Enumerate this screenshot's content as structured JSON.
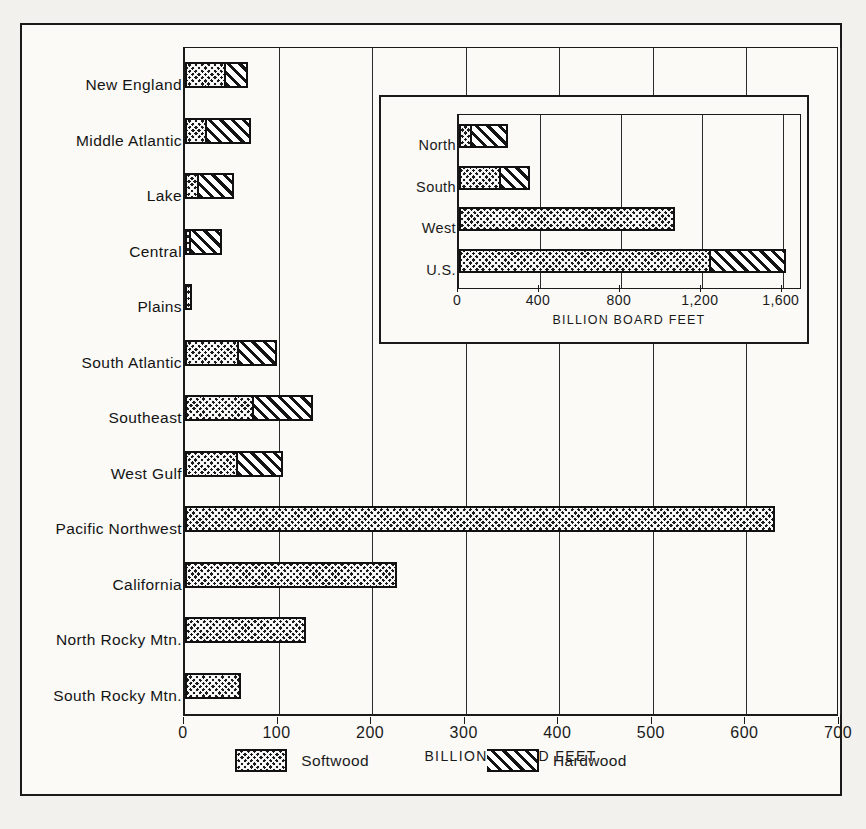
{
  "figure": {
    "legend": [
      {
        "key": "softwood",
        "label": "Softwood",
        "pattern": "crosshatch"
      },
      {
        "key": "hardwood",
        "label": "Hardwood",
        "pattern": "diagonal-hatch"
      }
    ]
  },
  "chart_data": [
    {
      "id": "main",
      "type": "bar",
      "orientation": "horizontal",
      "stacked": true,
      "title": "",
      "xlabel": "BILLION BOARD FEET",
      "ylabel": "",
      "xlim": [
        0,
        700
      ],
      "xticks": [
        0,
        100,
        200,
        300,
        400,
        500,
        600,
        700
      ],
      "xtick_labels": [
        "0",
        "100",
        "200",
        "300",
        "400",
        "500",
        "600",
        "700"
      ],
      "grid": "vertical",
      "legend_position": "bottom-center",
      "categories": [
        "New England",
        "Middle Atlantic",
        "Lake",
        "Central",
        "Plains",
        "South Atlantic",
        "Southeast",
        "West Gulf",
        "Pacific Northwest",
        "California",
        "North Rocky Mtn.",
        "South Rocky Mtn."
      ],
      "series": [
        {
          "name": "Softwood",
          "values": [
            42,
            20,
            12,
            2,
            8,
            56,
            72,
            55,
            630,
            227,
            129,
            60
          ]
        },
        {
          "name": "Hardwood",
          "values": [
            25,
            50,
            40,
            38,
            0,
            42,
            65,
            50,
            0,
            0,
            0,
            0
          ]
        }
      ],
      "totals": [
        67,
        70,
        52,
        40,
        8,
        98,
        137,
        105,
        630,
        227,
        129,
        60
      ]
    },
    {
      "id": "inset",
      "type": "bar",
      "orientation": "horizontal",
      "stacked": true,
      "title": "",
      "xlabel": "BILLION BOARD FEET",
      "ylabel": "",
      "xlim": [
        0,
        1700
      ],
      "xticks": [
        0,
        400,
        800,
        1200,
        1600
      ],
      "xtick_labels": [
        "0",
        "400",
        "800",
        "1,200",
        "1,600"
      ],
      "grid": "vertical",
      "categories": [
        "North",
        "South",
        "West",
        "U.S."
      ],
      "series": [
        {
          "name": "Softwood",
          "values": [
            47,
            198,
            1065,
            1240
          ]
        },
        {
          "name": "Hardwood",
          "values": [
            193,
            155,
            0,
            375
          ]
        }
      ],
      "totals": [
        240,
        353,
        1065,
        1615
      ]
    }
  ],
  "main_labels": {
    "new_england": "New England",
    "middle_atlantic": "Middle Atlantic",
    "lake": "Lake",
    "central": "Central",
    "plains": "Plains",
    "south_atlantic": "South Atlantic",
    "southeast": "Southeast",
    "west_gulf": "West Gulf",
    "pacific_northwest": "Pacific Northwest",
    "california": "California",
    "north_rocky": "North Rocky Mtn.",
    "south_rocky": "South Rocky Mtn."
  },
  "inset_labels": {
    "north": "North",
    "south": "South",
    "west": "West",
    "us": "U.S."
  },
  "colors": {
    "ink": "#1a1a1a",
    "paper": "#fbfaf7",
    "page": "#f2f1ee"
  }
}
